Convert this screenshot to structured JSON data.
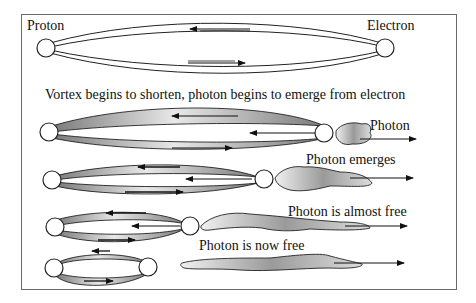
{
  "labels": {
    "proton": "Proton",
    "electron": "Electron",
    "caption": "Vortex begins to shorten, photon begins to emerge from electron",
    "stage1_photon": "Photon",
    "stage2_photon": "Photon emerges",
    "stage3_photon": "Photon is almost free",
    "stage4_photon": "Photon is now free"
  },
  "colors": {
    "frame": "#6a6a6a",
    "line": "#1a1a1a",
    "shade": "#8a8a8a",
    "background": "#ffffff"
  }
}
